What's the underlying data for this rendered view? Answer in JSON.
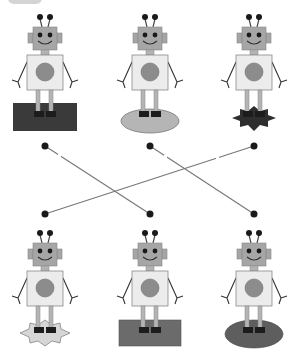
{
  "worksheet": {
    "title": "Match the robots to the bases",
    "badge_label": "",
    "colors": {
      "head": "#a6a6a6",
      "body": "#ececec",
      "body_stroke": "#8a8a8a",
      "chest_circle": "#8c8c8c",
      "eyes": "#1a1a1a",
      "legs": "#b4b4b4",
      "feet": "#1c1c1c",
      "line": "#777777",
      "dot": "#1a1a1a"
    },
    "top_row": [
      {
        "id": "robot-top-1",
        "base": "dark-rectangle",
        "base_color": "#3a3a3a",
        "cx": 45
      },
      {
        "id": "robot-top-2",
        "base": "light-oval",
        "base_color": "#b5b5b5",
        "cx": 150
      },
      {
        "id": "robot-top-3",
        "base": "dark-star",
        "base_color": "#2e2e2e",
        "cx": 254
      }
    ],
    "bottom_row": [
      {
        "id": "robot-bottom-1",
        "base": "light-star",
        "base_color": "#d6d6d6",
        "cx": 45
      },
      {
        "id": "robot-bottom-2",
        "base": "gray-rectangle",
        "base_color": "#6b6b6b",
        "cx": 150
      },
      {
        "id": "robot-bottom-3",
        "base": "gray-oval",
        "base_color": "#5e5e5e",
        "cx": 254
      }
    ],
    "connections": [
      {
        "from": "robot-top-1",
        "to": "robot-bottom-2"
      },
      {
        "from": "robot-top-2",
        "to": "robot-bottom-3"
      },
      {
        "from": "robot-top-3",
        "to": "robot-bottom-1"
      }
    ]
  }
}
